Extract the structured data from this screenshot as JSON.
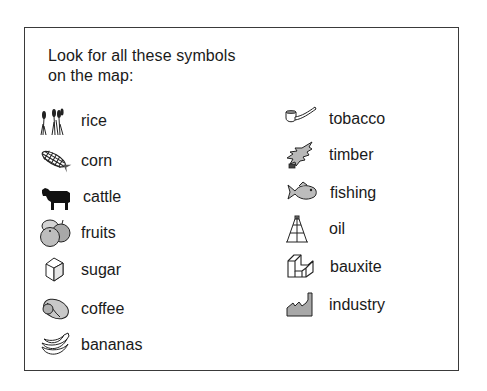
{
  "legend": {
    "title_line1": "Look for all these symbols",
    "title_line2": "on the map:",
    "left_items": [
      {
        "label": "rice",
        "icon": "rice-icon"
      },
      {
        "label": "corn",
        "icon": "corn-icon"
      },
      {
        "label": "cattle",
        "icon": "cattle-icon"
      },
      {
        "label": "fruits",
        "icon": "fruits-icon"
      },
      {
        "label": "sugar",
        "icon": "sugar-icon"
      },
      {
        "label": "coffee",
        "icon": "coffee-icon"
      },
      {
        "label": "bananas",
        "icon": "bananas-icon"
      }
    ],
    "right_items": [
      {
        "label": "tobacco",
        "icon": "tobacco-icon"
      },
      {
        "label": "timber",
        "icon": "timber-icon"
      },
      {
        "label": "fishing",
        "icon": "fishing-icon"
      },
      {
        "label": "oil",
        "icon": "oil-icon"
      },
      {
        "label": "bauxite",
        "icon": "bauxite-icon"
      },
      {
        "label": "industry",
        "icon": "industry-icon"
      }
    ]
  },
  "colors": {
    "border": "#3a3a3a",
    "text": "#1a1a1a",
    "icon_fill_gray": "#b5b5b5",
    "icon_stroke": "#333333"
  }
}
